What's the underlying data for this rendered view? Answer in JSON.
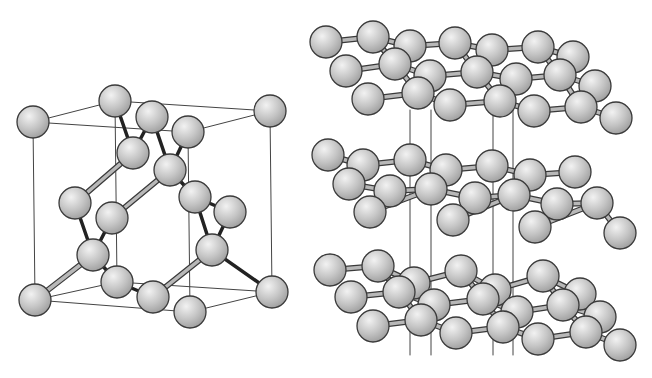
{
  "diagram": {
    "panels": [
      {
        "id": "diamond",
        "label": "Diamond cubic unit cell"
      },
      {
        "id": "graphite",
        "label": "Graphite stacked hexagonal layers"
      }
    ],
    "colors": {
      "background": "#ffffff",
      "atom_fill_light": "#f2f2f2",
      "atom_fill_mid": "#c4c4c4",
      "atom_fill_dark": "#9a9a9a",
      "atom_outline": "#3a3a3a",
      "cell_edge": "#444444",
      "bond_light": "#b8b8b8",
      "bond_dark": "#222222"
    },
    "diamond": {
      "atom_radius": 16,
      "cell_edges": [
        [
          33,
          122,
          115,
          101
        ],
        [
          115,
          101,
          270,
          111
        ],
        [
          33,
          122,
          188,
          132
        ],
        [
          188,
          132,
          270,
          111
        ],
        [
          33,
          122,
          35,
          300
        ],
        [
          270,
          111,
          272,
          292
        ],
        [
          115,
          101,
          117,
          282
        ],
        [
          188,
          132,
          190,
          312
        ],
        [
          35,
          300,
          117,
          282
        ],
        [
          117,
          282,
          272,
          292
        ],
        [
          35,
          300,
          190,
          312
        ],
        [
          190,
          312,
          272,
          292
        ]
      ],
      "bonds_light": [
        [
          133,
          153,
          75,
          203
        ],
        [
          170,
          170,
          112,
          218
        ],
        [
          93,
          255,
          35,
          300
        ],
        [
          212,
          250,
          153,
          297
        ]
      ],
      "bonds_dark": [
        [
          115,
          101,
          133,
          153
        ],
        [
          152,
          117,
          133,
          153
        ],
        [
          152,
          117,
          170,
          170
        ],
        [
          188,
          132,
          170,
          170
        ],
        [
          170,
          170,
          195,
          197
        ],
        [
          195,
          197,
          230,
          212
        ],
        [
          195,
          197,
          212,
          250
        ],
        [
          230,
          212,
          212,
          250
        ],
        [
          75,
          203,
          93,
          255
        ],
        [
          112,
          218,
          93,
          255
        ],
        [
          93,
          255,
          117,
          282
        ],
        [
          117,
          282,
          153,
          297
        ],
        [
          212,
          250,
          272,
          292
        ]
      ],
      "atoms": [
        [
          115,
          101
        ],
        [
          270,
          111
        ],
        [
          152,
          117
        ],
        [
          188,
          132
        ],
        [
          33,
          122
        ],
        [
          133,
          153
        ],
        [
          170,
          170
        ],
        [
          195,
          197
        ],
        [
          230,
          212
        ],
        [
          75,
          203
        ],
        [
          112,
          218
        ],
        [
          93,
          255
        ],
        [
          212,
          250
        ],
        [
          117,
          282
        ],
        [
          272,
          292
        ],
        [
          35,
          300
        ],
        [
          153,
          297
        ],
        [
          190,
          312
        ]
      ]
    },
    "graphite": {
      "atom_radius": 16,
      "interlayer_lines": [
        [
          410,
          110,
          410,
          355
        ],
        [
          431,
          110,
          431,
          355
        ],
        [
          493,
          110,
          493,
          355
        ],
        [
          513,
          110,
          513,
          355
        ]
      ],
      "layers": [
        {
          "name": "top-layer",
          "bonds": [
            [
              326,
              42,
              373,
              37
            ],
            [
              373,
              37,
              410,
              46
            ],
            [
              410,
              46,
              455,
              43
            ],
            [
              455,
              43,
              492,
              50
            ],
            [
              492,
              50,
              538,
              47
            ],
            [
              538,
              47,
              573,
              57
            ],
            [
              346,
              71,
              395,
              64
            ],
            [
              395,
              64,
              430,
              76
            ],
            [
              430,
              76,
              477,
              72
            ],
            [
              477,
              72,
              516,
              79
            ],
            [
              516,
              79,
              560,
              75
            ],
            [
              560,
              75,
              595,
              86
            ],
            [
              368,
              99,
              418,
              93
            ],
            [
              418,
              93,
              450,
              105
            ],
            [
              450,
              105,
              500,
              101
            ],
            [
              500,
              101,
              534,
              111
            ],
            [
              534,
              111,
              581,
              107
            ],
            [
              581,
              107,
              616,
              118
            ],
            [
              373,
              37,
              395,
              64
            ],
            [
              455,
              43,
              477,
              72
            ],
            [
              538,
              47,
              560,
              75
            ],
            [
              395,
              64,
              418,
              93
            ],
            [
              477,
              72,
              500,
              101
            ],
            [
              560,
              75,
              581,
              107
            ]
          ],
          "atoms": [
            [
              326,
              42
            ],
            [
              373,
              37
            ],
            [
              410,
              46
            ],
            [
              455,
              43
            ],
            [
              492,
              50
            ],
            [
              538,
              47
            ],
            [
              573,
              57
            ],
            [
              346,
              71
            ],
            [
              395,
              64
            ],
            [
              430,
              76
            ],
            [
              477,
              72
            ],
            [
              516,
              79
            ],
            [
              560,
              75
            ],
            [
              595,
              86
            ],
            [
              368,
              99
            ],
            [
              418,
              93
            ],
            [
              450,
              105
            ],
            [
              500,
              101
            ],
            [
              534,
              111
            ],
            [
              581,
              107
            ],
            [
              616,
              118
            ]
          ]
        },
        {
          "name": "middle-layer",
          "bonds": [
            [
              328,
              155,
              363,
              165
            ],
            [
              363,
              165,
              410,
              160
            ],
            [
              410,
              160,
              446,
              170
            ],
            [
              446,
              170,
              492,
              166
            ],
            [
              492,
              166,
              530,
              175
            ],
            [
              530,
              175,
              575,
              172
            ],
            [
              349,
              184,
              390,
              191
            ],
            [
              390,
              191,
              431,
              189
            ],
            [
              431,
              189,
              475,
              198
            ],
            [
              475,
              198,
              514,
              195
            ],
            [
              514,
              195,
              557,
              204
            ],
            [
              557,
              204,
              597,
              203
            ],
            [
              370,
              212,
              431,
              189
            ],
            [
              453,
              220,
              514,
              195
            ],
            [
              535,
              227,
              597,
              203
            ],
            [
              597,
              203,
              620,
              233
            ]
          ],
          "atoms": [
            [
              328,
              155
            ],
            [
              363,
              165
            ],
            [
              410,
              160
            ],
            [
              446,
              170
            ],
            [
              492,
              166
            ],
            [
              530,
              175
            ],
            [
              575,
              172
            ],
            [
              349,
              184
            ],
            [
              390,
              191
            ],
            [
              431,
              189
            ],
            [
              475,
              198
            ],
            [
              514,
              195
            ],
            [
              557,
              204
            ],
            [
              597,
              203
            ],
            [
              370,
              212
            ],
            [
              453,
              220
            ],
            [
              535,
              227
            ],
            [
              620,
              233
            ]
          ]
        },
        {
          "name": "bottom-layer",
          "bonds": [
            [
              330,
              270,
              378,
              266
            ],
            [
              378,
              266,
              414,
              283
            ],
            [
              414,
              283,
              461,
              271
            ],
            [
              461,
              271,
              495,
              290
            ],
            [
              495,
              290,
              543,
              276
            ],
            [
              543,
              276,
              580,
              294
            ],
            [
              351,
              297,
              399,
              292
            ],
            [
              399,
              292,
              434,
              305
            ],
            [
              434,
              305,
              483,
              299
            ],
            [
              483,
              299,
              517,
              312
            ],
            [
              517,
              312,
              563,
              305
            ],
            [
              563,
              305,
              600,
              317
            ],
            [
              373,
              326,
              421,
              320
            ],
            [
              421,
              320,
              456,
              333
            ],
            [
              456,
              333,
              503,
              327
            ],
            [
              503,
              327,
              538,
              339
            ],
            [
              538,
              339,
              586,
              332
            ],
            [
              586,
              332,
              620,
              345
            ],
            [
              378,
              266,
              399,
              292
            ],
            [
              461,
              271,
              483,
              299
            ],
            [
              543,
              276,
              563,
              305
            ],
            [
              399,
              292,
              421,
              320
            ],
            [
              483,
              299,
              503,
              327
            ],
            [
              563,
              305,
              586,
              332
            ]
          ],
          "atoms": [
            [
              330,
              270
            ],
            [
              378,
              266
            ],
            [
              414,
              283
            ],
            [
              461,
              271
            ],
            [
              495,
              290
            ],
            [
              543,
              276
            ],
            [
              580,
              294
            ],
            [
              351,
              297
            ],
            [
              399,
              292
            ],
            [
              434,
              305
            ],
            [
              483,
              299
            ],
            [
              517,
              312
            ],
            [
              563,
              305
            ],
            [
              600,
              317
            ],
            [
              373,
              326
            ],
            [
              421,
              320
            ],
            [
              456,
              333
            ],
            [
              503,
              327
            ],
            [
              538,
              339
            ],
            [
              586,
              332
            ],
            [
              620,
              345
            ]
          ]
        }
      ]
    }
  }
}
